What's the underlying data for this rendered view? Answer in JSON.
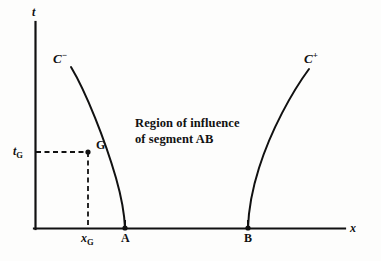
{
  "figure": {
    "background_color": "#fdfdfc",
    "ink_color": "#111111"
  },
  "axes": {
    "vertical": {
      "label": "t",
      "x_px": 35,
      "top_px": 22,
      "bottom_px": 228
    },
    "horizontal": {
      "label": "x",
      "y_px": 228,
      "left_px": 35,
      "right_px": 345
    }
  },
  "annotation": {
    "line1": "Region of influence",
    "line2": "of segment AB"
  },
  "curves": [
    {
      "name": "C-minus",
      "label": "C",
      "superscript": "−",
      "label_x_px": 54,
      "label_y_px": 50,
      "description": "left characteristic from point A curving up and to the left"
    },
    {
      "name": "C-plus",
      "label": "C",
      "superscript": "+",
      "label_x_px": 305,
      "label_y_px": 50,
      "description": "right characteristic from point B curving up and to the right"
    }
  ],
  "points": [
    {
      "name": "A",
      "label": "A",
      "x_px": 125,
      "y_px": 228,
      "marked": true
    },
    {
      "name": "B",
      "label": "B",
      "x_px": 248,
      "y_px": 228,
      "marked": true
    },
    {
      "name": "G",
      "label": "G",
      "x_px": 88,
      "y_px": 152,
      "marked": true
    }
  ],
  "tick_labels": {
    "t_sub": {
      "base": "t",
      "sub": "G",
      "x_px": 12,
      "y_px": 145
    },
    "x_sub": {
      "base": "x",
      "sub": "G",
      "x_px": 80,
      "y_px": 232
    }
  },
  "guides": {
    "horizontal_dashed": {
      "from_x_px": 35,
      "to_x_px": 88,
      "y_px": 152
    },
    "vertical_dashed": {
      "x_px": 88,
      "from_y_px": 152,
      "to_y_px": 228
    }
  },
  "colors": {
    "ink": "#111111",
    "paper": "#fdfdfc"
  }
}
